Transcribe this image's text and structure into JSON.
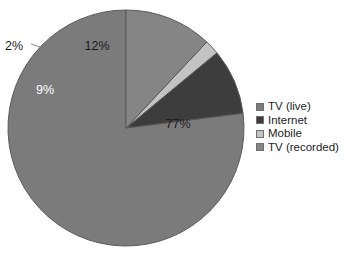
{
  "chart_data": {
    "type": "pie",
    "title": "",
    "subtitle": "",
    "xlabel": "",
    "ylabel": "",
    "grid": false,
    "legend_position": "right",
    "start_angle_deg": 90,
    "direction": "counterclockwise",
    "categories": [
      "TV (live)",
      "Internet",
      "Mobile",
      "TV (recorded)"
    ],
    "values": [
      77,
      9,
      2,
      12
    ],
    "value_labels": [
      "77%",
      "9%",
      "2%",
      "12%"
    ],
    "colors": [
      "#7b7b7b",
      "#3d3d3d",
      "#c3c3c3",
      "#858585"
    ],
    "slices": [
      {
        "name": "TV (live)",
        "value": 77,
        "label": "77%",
        "color": "#7b7b7b",
        "label_color": "#1c1c1c",
        "label_x": 178,
        "label_y": 125,
        "label_position": "inside"
      },
      {
        "name": "Internet",
        "value": 9,
        "label": "9%",
        "color": "#3d3d3d",
        "label_color": "#ffffff",
        "label_x": 45,
        "label_y": 91,
        "label_position": "inside"
      },
      {
        "name": "Mobile",
        "value": 2,
        "label": "2%",
        "color": "#c3c3c3",
        "label_color": "#1c1c1c",
        "label_x": 14,
        "label_y": 47,
        "label_position": "outside"
      },
      {
        "name": "TV (recorded)",
        "value": 12,
        "label": "12%",
        "color": "#858585",
        "label_color": "#1c1c1c",
        "label_x": 97,
        "label_y": 47,
        "label_position": "inside"
      }
    ]
  },
  "pie": {
    "center_x": 126,
    "center_y": 128,
    "radius": 118,
    "outline_color": "#5a5a5a",
    "leader_line_color": "#7a7a7a"
  },
  "legend": {
    "items": [
      {
        "label": "TV (live)",
        "color": "#7b7b7b"
      },
      {
        "label": "Internet",
        "color": "#3d3d3d"
      },
      {
        "label": "Mobile",
        "color": "#c3c3c3"
      },
      {
        "label": "TV (recorded)",
        "color": "#858585"
      }
    ]
  },
  "background": "#ffffff"
}
